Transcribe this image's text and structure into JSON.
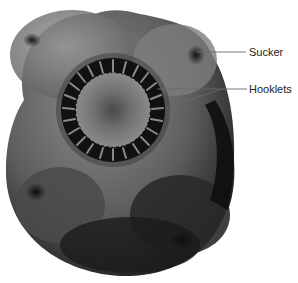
{
  "figure": {
    "labels": [
      {
        "id": "sucker",
        "text": "Sucker",
        "leader_color": "#666666"
      },
      {
        "id": "hooklets",
        "text": "Hooklets",
        "leader_color": "#666666"
      }
    ]
  },
  "colors": {
    "background": "#ffffff",
    "specimen_light": "#8a8a8a",
    "specimen_mid": "#5a5a5a",
    "specimen_dark": "#1a1a1a",
    "text": "#222222"
  }
}
